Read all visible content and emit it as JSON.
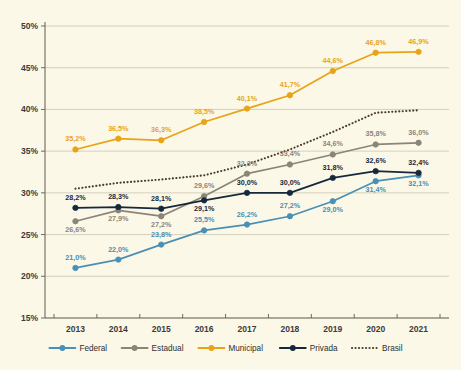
{
  "chart_data": {
    "type": "line",
    "title": "",
    "subtitle": "",
    "xlabel": "",
    "ylabel": "",
    "categories": [
      "2013",
      "2014",
      "2015",
      "2016",
      "2017",
      "2018",
      "2019",
      "2020",
      "2021"
    ],
    "ylim": [
      15,
      50
    ],
    "ytick_labels": [
      "15%",
      "20%",
      "25%",
      "30%",
      "35%",
      "40%",
      "45%",
      "50%"
    ],
    "ytick_values": [
      15,
      20,
      25,
      30,
      35,
      40,
      45,
      50
    ],
    "grid": true,
    "legend_position": "bottom",
    "value_suffix": "%",
    "decimal_separator": ",",
    "series": [
      {
        "name": "Federal",
        "color": "#4a8fb5",
        "style": "solid",
        "marker": "circle",
        "values": [
          21.0,
          22.0,
          23.8,
          25.5,
          26.2,
          27.2,
          29.0,
          31.4,
          32.1
        ],
        "labels": [
          "21,0%",
          "22,0%",
          "23,8%",
          "25,5%",
          "26,2%",
          "27,2%",
          "29,0%",
          "31,4%",
          "32,1%"
        ]
      },
      {
        "name": "Estadual",
        "color": "#8a8578",
        "style": "solid",
        "marker": "circle",
        "values": [
          26.6,
          27.9,
          27.2,
          29.6,
          32.3,
          33.4,
          34.6,
          35.8,
          36.0
        ],
        "labels": [
          "26,6%",
          "27,9%",
          "27,2%",
          "29,6%",
          "32,3%",
          "33,4%",
          "34,6%",
          "35,8%",
          "36,0%"
        ]
      },
      {
        "name": "Municipal",
        "color": "#e8a317",
        "style": "solid",
        "marker": "circle",
        "values": [
          35.2,
          36.5,
          36.3,
          38.5,
          40.1,
          41.7,
          44.6,
          46.8,
          46.9
        ],
        "labels": [
          "35,2%",
          "36,5%",
          "36,3%",
          "38,5%",
          "40,1%",
          "41,7%",
          "44,6%",
          "46,8%",
          "46,9%"
        ]
      },
      {
        "name": "Privada",
        "color": "#16283c",
        "style": "solid",
        "marker": "circle",
        "values": [
          28.2,
          28.3,
          28.1,
          29.1,
          30.0,
          30.0,
          31.8,
          32.6,
          32.4
        ],
        "labels": [
          "28,2%",
          "28,3%",
          "28,1%",
          "29,1%",
          "30,0%",
          "30,0%",
          "31,8%",
          "32,6%",
          "32,4%"
        ]
      },
      {
        "name": "Brasil",
        "color": "#4a3b2a",
        "style": "dotted",
        "marker": "none",
        "values": [
          30.5,
          31.2,
          31.6,
          32.1,
          33.4,
          35.2,
          37.3,
          39.6,
          39.9
        ],
        "labels": [
          "",
          "",
          "",
          "",
          "",
          "",
          "",
          "",
          ""
        ]
      }
    ]
  },
  "legend": {
    "items": [
      {
        "label": "Federal",
        "color": "#4a8fb5",
        "style": "solid"
      },
      {
        "label": "Estadual",
        "color": "#8a8578",
        "style": "solid"
      },
      {
        "label": "Municipal",
        "color": "#e8a317",
        "style": "solid"
      },
      {
        "label": "Privada",
        "color": "#16283c",
        "style": "solid"
      },
      {
        "label": "Brasil",
        "color": "#4a3b2a",
        "style": "dotted"
      }
    ]
  }
}
